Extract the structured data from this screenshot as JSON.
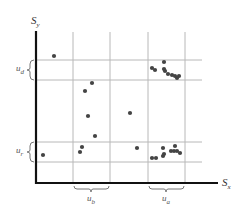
{
  "diagram": {
    "type": "scatter-with-bands",
    "colors": {
      "axis": "#111111",
      "grid": "#b8b8b8",
      "point": "#444444",
      "brace": "#777777"
    },
    "axes": {
      "x_label": "S",
      "x_sub": "x",
      "y_label": "S",
      "y_sub": "y"
    },
    "bands": {
      "u_d": {
        "label": "u",
        "sub": "d",
        "orientation": "horizontal"
      },
      "u_r": {
        "label": "u",
        "sub": "r",
        "orientation": "horizontal"
      },
      "u_b": {
        "label": "u",
        "sub": "b",
        "orientation": "vertical"
      },
      "u_a": {
        "label": "u",
        "sub": "a",
        "orientation": "vertical"
      }
    },
    "points": [
      {
        "x": 54,
        "y": 56
      },
      {
        "x": 92,
        "y": 83
      },
      {
        "x": 85,
        "y": 91
      },
      {
        "x": 88,
        "y": 116
      },
      {
        "x": 95,
        "y": 136
      },
      {
        "x": 82,
        "y": 147
      },
      {
        "x": 80,
        "y": 152
      },
      {
        "x": 43,
        "y": 155
      },
      {
        "x": 130,
        "y": 113
      },
      {
        "x": 137,
        "y": 148
      },
      {
        "x": 152,
        "y": 68
      },
      {
        "x": 155,
        "y": 70
      },
      {
        "x": 164,
        "y": 62
      },
      {
        "x": 164,
        "y": 69
      },
      {
        "x": 165,
        "y": 71
      },
      {
        "x": 168,
        "y": 74
      },
      {
        "x": 172,
        "y": 75
      },
      {
        "x": 175,
        "y": 76
      },
      {
        "x": 177,
        "y": 78
      },
      {
        "x": 179,
        "y": 76
      },
      {
        "x": 152,
        "y": 158
      },
      {
        "x": 156,
        "y": 158
      },
      {
        "x": 163,
        "y": 156
      },
      {
        "x": 164,
        "y": 154
      },
      {
        "x": 163,
        "y": 148
      },
      {
        "x": 171,
        "y": 151
      },
      {
        "x": 174,
        "y": 151
      },
      {
        "x": 175,
        "y": 146
      },
      {
        "x": 177,
        "y": 151
      },
      {
        "x": 180,
        "y": 153
      }
    ]
  }
}
